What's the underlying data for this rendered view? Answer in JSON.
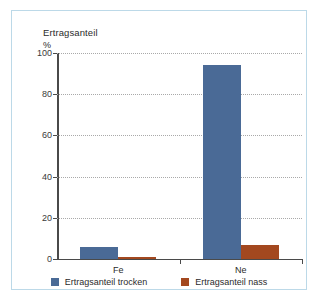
{
  "chart_data": {
    "type": "bar",
    "title": "Ertragsanteil",
    "ylabel": "%",
    "xlabel": "",
    "categories": [
      "Fe",
      "Ne"
    ],
    "series": [
      {
        "name": "Ertragsanteil trocken",
        "color": "#4a6a96",
        "values": [
          6,
          94
        ]
      },
      {
        "name": "Ertragsanteil nass",
        "color": "#a3481f",
        "values": [
          1,
          7
        ]
      }
    ],
    "ylim": [
      0,
      100
    ],
    "yticks": [
      0,
      20,
      40,
      60,
      80,
      100
    ],
    "ytick_labels": [
      "0",
      "20",
      "40",
      "60",
      "80",
      "100"
    ],
    "grid": true,
    "legend_position": "bottom"
  },
  "frame": {
    "border_color": "#bcd9e8"
  }
}
